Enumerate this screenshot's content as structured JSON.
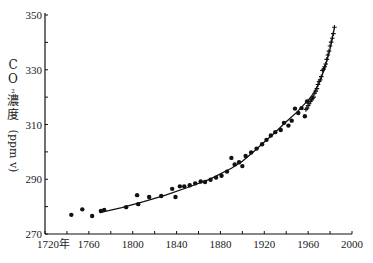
{
  "chart_data": {
    "type": "scatter",
    "title": "",
    "xlabel": "",
    "ylabel": "CO₂濃度(ppmv)",
    "ylabel_parts": {
      "vertical_chars": [
        "C",
        "O",
        "₂",
        "濃",
        "度"
      ],
      "rotated": "(ppm v)"
    },
    "xlim": [
      1720,
      2000
    ],
    "ylim": [
      270,
      350
    ],
    "x_ticks": [
      1720,
      1760,
      1800,
      1840,
      1880,
      1920,
      1960,
      2000
    ],
    "x_tick_labels": [
      "1720年",
      "1760",
      "1800",
      "1840",
      "1880",
      "1920",
      "1960",
      "2000"
    ],
    "x_minor_ticks": [
      1740,
      1780,
      1820,
      1860,
      1900,
      1940,
      1980
    ],
    "y_ticks": [
      270,
      290,
      310,
      330,
      350
    ],
    "y_tick_labels": [
      "270",
      "290",
      "310",
      "330",
      "350"
    ],
    "y_minor_ticks": [
      280,
      300,
      320,
      340
    ],
    "grid": false,
    "legend": null,
    "series": [
      {
        "name": "ice core (dots)",
        "marker": "circle",
        "points": [
          [
            1744,
            277.0
          ],
          [
            1754,
            279.0
          ],
          [
            1763,
            276.6
          ],
          [
            1771,
            278.4
          ],
          [
            1774,
            278.8
          ],
          [
            1794,
            279.8
          ],
          [
            1804,
            284.2
          ],
          [
            1805,
            280.9
          ],
          [
            1815,
            283.5
          ],
          [
            1826,
            283.9
          ],
          [
            1836,
            286.5
          ],
          [
            1839,
            283.5
          ],
          [
            1843,
            287.4
          ],
          [
            1847,
            287.4
          ],
          [
            1852,
            287.8
          ],
          [
            1857,
            288.5
          ],
          [
            1862,
            289.2
          ],
          [
            1866,
            289.0
          ],
          [
            1871,
            289.8
          ],
          [
            1876,
            290.6
          ],
          [
            1881,
            291.3
          ],
          [
            1886,
            292.8
          ],
          [
            1890,
            297.8
          ],
          [
            1893,
            295.4
          ],
          [
            1897,
            296.2
          ],
          [
            1900,
            294.8
          ],
          [
            1903,
            298.5
          ],
          [
            1908,
            299.8
          ],
          [
            1913,
            301.2
          ],
          [
            1918,
            302.8
          ],
          [
            1922,
            304.4
          ],
          [
            1926,
            306.0
          ],
          [
            1930,
            307.2
          ],
          [
            1935,
            308.0
          ],
          [
            1938,
            310.6
          ],
          [
            1942,
            309.6
          ],
          [
            1945,
            311.4
          ],
          [
            1948,
            315.8
          ],
          [
            1951,
            314.2
          ],
          [
            1954,
            316.0
          ],
          [
            1957,
            313.0
          ],
          [
            1959,
            318.4
          ]
        ]
      },
      {
        "name": "direct measurement (+)",
        "marker": "plus",
        "points": [
          [
            1958,
            315.5
          ],
          [
            1959,
            316.0
          ],
          [
            1960,
            316.9
          ],
          [
            1961,
            317.6
          ],
          [
            1962,
            318.4
          ],
          [
            1963,
            319.0
          ],
          [
            1964,
            319.6
          ],
          [
            1965,
            320.0
          ],
          [
            1966,
            321.4
          ],
          [
            1967,
            322.2
          ],
          [
            1968,
            323.1
          ],
          [
            1969,
            324.6
          ],
          [
            1970,
            325.7
          ],
          [
            1971,
            326.3
          ],
          [
            1972,
            327.5
          ],
          [
            1973,
            329.7
          ],
          [
            1974,
            330.2
          ],
          [
            1975,
            331.1
          ],
          [
            1976,
            332.1
          ],
          [
            1977,
            333.8
          ],
          [
            1978,
            335.4
          ],
          [
            1979,
            336.8
          ],
          [
            1980,
            338.7
          ],
          [
            1981,
            340.1
          ],
          [
            1982,
            341.5
          ],
          [
            1983,
            343.2
          ],
          [
            1984,
            345.5
          ]
        ]
      },
      {
        "name": "fitted curve",
        "marker": "line",
        "points": [
          [
            1770,
            277.8
          ],
          [
            1790,
            279.6
          ],
          [
            1810,
            281.8
          ],
          [
            1830,
            284.2
          ],
          [
            1850,
            287.0
          ],
          [
            1870,
            290.0
          ],
          [
            1890,
            294.0
          ],
          [
            1900,
            296.6
          ],
          [
            1910,
            300.0
          ],
          [
            1920,
            303.6
          ],
          [
            1930,
            307.2
          ],
          [
            1940,
            311.0
          ],
          [
            1950,
            314.6
          ],
          [
            1955,
            316.8
          ],
          [
            1960,
            318.8
          ],
          [
            1965,
            321.4
          ],
          [
            1970,
            325.2
          ],
          [
            1975,
            330.4
          ],
          [
            1980,
            337.6
          ],
          [
            1984,
            345.5
          ]
        ]
      }
    ],
    "colors": {
      "ink": "#111111",
      "background": "#ffffff"
    }
  }
}
